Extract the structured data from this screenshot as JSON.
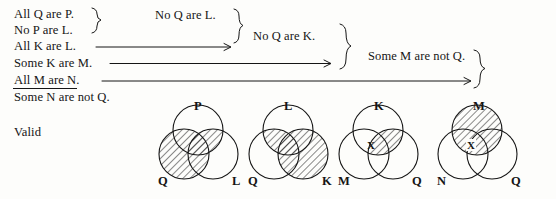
{
  "document": {
    "type": "syllogism-proof-diagram",
    "verdict": "Valid",
    "ink_color": "#151515",
    "background": "#fdfdfb"
  },
  "premises": [
    {
      "id": "p1",
      "text": "All Q are P."
    },
    {
      "id": "p2",
      "text": "No P are L."
    },
    {
      "id": "p3",
      "text": "All K are L."
    },
    {
      "id": "p4",
      "text": "Some K are M."
    },
    {
      "id": "p5",
      "text": "All M are N."
    }
  ],
  "conclusion": {
    "text": "Some N are not Q."
  },
  "intermediates": [
    {
      "id": "i1",
      "text": "No Q are L."
    },
    {
      "id": "i2",
      "text": "No Q are K."
    },
    {
      "id": "i3",
      "text": "Some M are not Q."
    }
  ],
  "verdict_label": "Valid",
  "venn_diagrams": [
    {
      "id": "venn-1",
      "top_label": "P",
      "left_label": "Q",
      "right_label": "L",
      "shaded": [
        "Q-circle",
        "Q-and-P-overlap"
      ],
      "x_mark": null
    },
    {
      "id": "venn-2",
      "top_label": "L",
      "left_label": "Q",
      "right_label": "K",
      "shaded": [
        "K-circle",
        "L-and-Q-overlap"
      ],
      "x_mark": null
    },
    {
      "id": "venn-3",
      "top_label": "K",
      "left_label": "M",
      "right_label": "Q",
      "shaded": [
        "K-and-Q-overlap"
      ],
      "x_mark": {
        "label": "X",
        "region": "K-and-M-overlap"
      }
    },
    {
      "id": "venn-4",
      "top_label": "M",
      "left_label": "N",
      "right_label": "Q",
      "shaded": [
        "M-circle"
      ],
      "x_mark": {
        "label": "X",
        "region": "M-and-N-overlap"
      }
    }
  ]
}
